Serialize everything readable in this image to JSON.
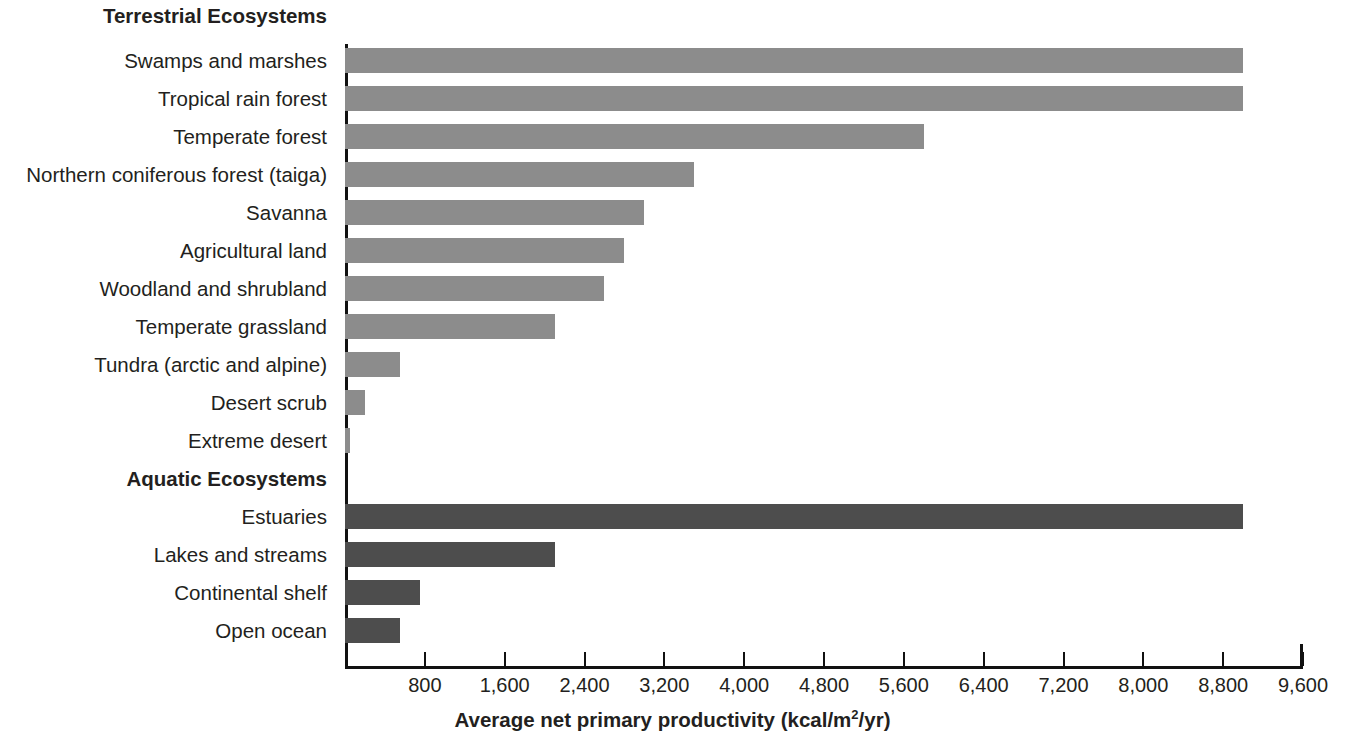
{
  "chart_data": {
    "type": "bar",
    "orientation": "horizontal",
    "title": "",
    "xlabel": "Average net primary productivity (kcal/m2/yr)",
    "xlabel_parts": {
      "before": "Average net primary productivity (kcal/m",
      "sup": "2",
      "after": "/yr)"
    },
    "ylabel": "",
    "xlim": [
      0,
      9600
    ],
    "xticks": [
      800,
      1600,
      2400,
      3200,
      4000,
      4800,
      5600,
      6400,
      7200,
      8000,
      8800,
      9600
    ],
    "xtick_labels": [
      "800",
      "1,600",
      "2,400",
      "3,200",
      "4,000",
      "4,800",
      "5,600",
      "6,400",
      "7,200",
      "8,000",
      "8,800",
      "9,600"
    ],
    "grid": false,
    "legend": "none",
    "groups": [
      {
        "name": "Terrestrial Ecosystems",
        "color": "#8c8c8c",
        "categories": [
          "Swamps and marshes",
          "Tropical rain forest",
          "Temperate forest",
          "Northern coniferous forest (taiga)",
          "Savanna",
          "Agricultural land",
          "Woodland and shrubland",
          "Temperate grassland",
          "Tundra (arctic and alpine)",
          "Desert scrub",
          "Extreme desert"
        ],
        "values": [
          9000,
          9000,
          5800,
          3500,
          3000,
          2800,
          2600,
          2100,
          550,
          200,
          50
        ]
      },
      {
        "name": "Aquatic Ecosystems",
        "color": "#4d4d4d",
        "categories": [
          "Estuaries",
          "Lakes and streams",
          "Continental shelf",
          "Open ocean"
        ],
        "values": [
          9000,
          2100,
          750,
          550
        ]
      }
    ]
  },
  "sections": {
    "terrestrial_header": "Terrestrial Ecosystems",
    "aquatic_header": "Aquatic Ecosystems"
  },
  "colors": {
    "terrestrial_bar": "#8c8c8c",
    "aquatic_bar": "#4d4d4d",
    "axis": "#111111",
    "text": "#231f20",
    "background": "#ffffff"
  }
}
